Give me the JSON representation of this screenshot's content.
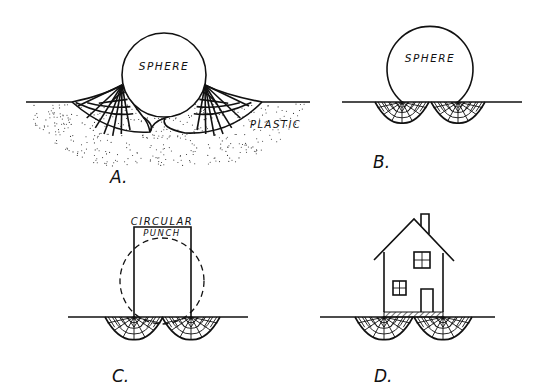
{
  "panels": {
    "a": {
      "caption": "A.",
      "sphere_label": "SPHERE",
      "material_label": "PLASTIC"
    },
    "b": {
      "caption": "B.",
      "sphere_label": "SPHERE"
    },
    "c": {
      "caption": "C.",
      "punch_label_line1": "CIRCULAR",
      "punch_label_line2": "PUNCH"
    },
    "d": {
      "caption": "D."
    }
  },
  "colors": {
    "ink": "#111111",
    "background": "#ffffff"
  }
}
